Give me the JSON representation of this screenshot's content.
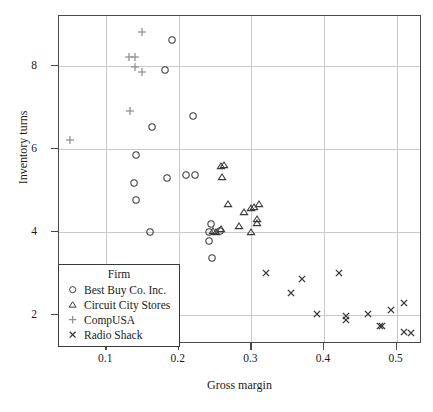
{
  "chart_data": {
    "type": "scatter",
    "title": "",
    "xlabel": "Gross margin",
    "ylabel": "Inventory turns",
    "legend_title": "Firm",
    "legend_position": "bottom-left-inside",
    "grid": true,
    "xlim": [
      0.035,
      0.535
    ],
    "ylim": [
      1.3,
      9.2
    ],
    "xticks": [
      0.1,
      0.2,
      0.3,
      0.4,
      0.5
    ],
    "xtick_labels": [
      "0.1",
      "0.2",
      "0.3",
      "0.4",
      "0.5"
    ],
    "yticks": [
      2,
      4,
      6,
      8
    ],
    "ytick_labels": [
      "2",
      "4",
      "6",
      "8"
    ],
    "colors": {
      "marker": "#3a3a3a",
      "compusa_marker": "#8a8a8a",
      "frame": "#4a4a4a",
      "grid": "#c9c9c9",
      "background": "#ffffff"
    },
    "series": [
      {
        "name": "Best Buy Co. Inc.",
        "marker": "circle",
        "points": [
          [
            0.19,
            8.62
          ],
          [
            0.181,
            7.9
          ],
          [
            0.22,
            6.8
          ],
          [
            0.163,
            6.52
          ],
          [
            0.141,
            5.86
          ],
          [
            0.184,
            5.3
          ],
          [
            0.138,
            5.18
          ],
          [
            0.21,
            5.38
          ],
          [
            0.222,
            5.38
          ],
          [
            0.141,
            4.78
          ],
          [
            0.244,
            4.18
          ],
          [
            0.16,
            4.0
          ],
          [
            0.242,
            4.0
          ],
          [
            0.257,
            4.02
          ],
          [
            0.241,
            3.78
          ],
          [
            0.246,
            3.36
          ]
        ]
      },
      {
        "name": "Circuit City Stores",
        "marker": "triangle",
        "points": [
          [
            0.258,
            5.58
          ],
          [
            0.262,
            5.6
          ],
          [
            0.259,
            5.32
          ],
          [
            0.268,
            4.68
          ],
          [
            0.29,
            4.48
          ],
          [
            0.3,
            4.58
          ],
          [
            0.303,
            4.6
          ],
          [
            0.311,
            4.68
          ],
          [
            0.308,
            4.32
          ],
          [
            0.308,
            4.22
          ],
          [
            0.283,
            4.14
          ],
          [
            0.247,
            4.02
          ],
          [
            0.251,
            4.0
          ],
          [
            0.258,
            4.08
          ],
          [
            0.299,
            4.0
          ]
        ]
      },
      {
        "name": "CompUSA",
        "marker": "plus",
        "points": [
          [
            0.149,
            8.82
          ],
          [
            0.132,
            8.22
          ],
          [
            0.139,
            8.22
          ],
          [
            0.139,
            7.98
          ],
          [
            0.15,
            7.84
          ],
          [
            0.133,
            6.9
          ],
          [
            0.05,
            6.22
          ]
        ]
      },
      {
        "name": "Radio Shack",
        "marker": "cross",
        "points": [
          [
            0.32,
            3.0
          ],
          [
            0.37,
            2.86
          ],
          [
            0.355,
            2.52
          ],
          [
            0.42,
            3.0
          ],
          [
            0.39,
            2.02
          ],
          [
            0.43,
            1.98
          ],
          [
            0.43,
            1.88
          ],
          [
            0.46,
            2.02
          ],
          [
            0.477,
            1.74
          ],
          [
            0.48,
            1.74
          ],
          [
            0.492,
            2.12
          ],
          [
            0.51,
            2.28
          ],
          [
            0.51,
            1.58
          ],
          [
            0.52,
            1.56
          ]
        ]
      }
    ]
  },
  "legend": {
    "title": "Firm",
    "entries": [
      {
        "label": "Best Buy Co. Inc.",
        "marker": "circle"
      },
      {
        "label": "Circuit City Stores",
        "marker": "triangle"
      },
      {
        "label": "CompUSA",
        "marker": "plus"
      },
      {
        "label": "Radio Shack",
        "marker": "cross"
      }
    ]
  }
}
